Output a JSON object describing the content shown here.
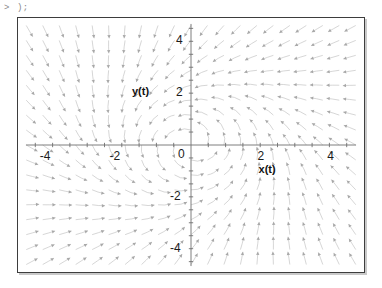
{
  "worksheet": {
    "prompt": {
      "caret": ">",
      "text": ");"
    }
  },
  "plot": {
    "xlabel": "x(t)",
    "ylabel": "y(t)",
    "x_ticks": [
      {
        "value": -4,
        "label": "-4"
      },
      {
        "value": -2,
        "label": "-2"
      },
      {
        "value": 0,
        "label": "0"
      },
      {
        "value": 2,
        "label": "2"
      },
      {
        "value": 4,
        "label": "4"
      }
    ],
    "y_ticks": [
      {
        "value": 4,
        "label": "4"
      },
      {
        "value": 2,
        "label": "2"
      },
      {
        "value": -2,
        "label": "-2"
      },
      {
        "value": -4,
        "label": "-4"
      }
    ]
  },
  "chart_data": {
    "type": "scatter",
    "title": "",
    "xlabel": "x(t)",
    "ylabel": "y(t)",
    "xlim": [
      -5,
      5
    ],
    "ylim": [
      -4.9,
      4.9
    ],
    "grid": false,
    "legend": null,
    "field": {
      "kind": "direction-field",
      "u_expression": "-y - 0.08*x*(x^2+y^2)",
      "v_expression": "x - 0.08*y*(x^2+y^2)",
      "grid_nx": 21,
      "grid_ny": 17,
      "arrow_color": "#b9b9b9"
    },
    "x_tick_values": [
      -4,
      -2,
      0,
      2,
      4
    ],
    "y_tick_values": [
      -4,
      -2,
      0,
      2,
      4
    ],
    "x_tick_labels": [
      "-4",
      "-2",
      "0",
      "2",
      "4"
    ],
    "y_tick_labels": [
      "-4",
      "-2",
      "",
      "2",
      "4"
    ],
    "axes_color": "#6e6e6e",
    "frame_color": "#3d3d3d"
  }
}
